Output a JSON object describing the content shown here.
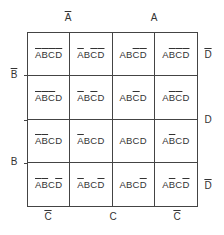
{
  "top_labels": [
    {
      "text": "A",
      "negated": true
    },
    {
      "text": "A",
      "negated": false
    }
  ],
  "left_labels": [
    {
      "text": "B",
      "negated": true
    },
    {
      "text": "B",
      "negated": false
    }
  ],
  "right_labels": [
    {
      "text": "D",
      "negated": true
    },
    {
      "text": "D",
      "negated": false
    },
    {
      "text": "D",
      "negated": true
    }
  ],
  "bottom_labels": [
    {
      "text": "C",
      "negated": true
    },
    {
      "text": "C",
      "negated": false
    },
    {
      "text": "C",
      "negated": true
    }
  ],
  "cells": [
    [
      {
        "A": true,
        "B": true,
        "C": true,
        "D": true
      },
      {
        "A": true,
        "B": false,
        "C": true,
        "D": true
      },
      {
        "A": false,
        "B": false,
        "C": true,
        "D": true
      },
      {
        "A": false,
        "B": true,
        "C": true,
        "D": true
      }
    ],
    [
      {
        "A": true,
        "B": true,
        "C": true,
        "D": false
      },
      {
        "A": true,
        "B": false,
        "C": true,
        "D": false
      },
      {
        "A": false,
        "B": false,
        "C": true,
        "D": false
      },
      {
        "A": false,
        "B": true,
        "C": true,
        "D": false
      }
    ],
    [
      {
        "A": true,
        "B": true,
        "C": false,
        "D": false
      },
      {
        "A": true,
        "B": false,
        "C": false,
        "D": false
      },
      {
        "A": false,
        "B": false,
        "C": false,
        "D": false
      },
      {
        "A": false,
        "B": true,
        "C": false,
        "D": false
      }
    ],
    [
      {
        "A": true,
        "B": true,
        "C": false,
        "D": true
      },
      {
        "A": true,
        "B": false,
        "C": false,
        "D": true
      },
      {
        "A": false,
        "B": false,
        "C": false,
        "D": true
      },
      {
        "A": false,
        "B": true,
        "C": false,
        "D": true
      }
    ]
  ],
  "variables": [
    "A",
    "B",
    "C",
    "D"
  ]
}
